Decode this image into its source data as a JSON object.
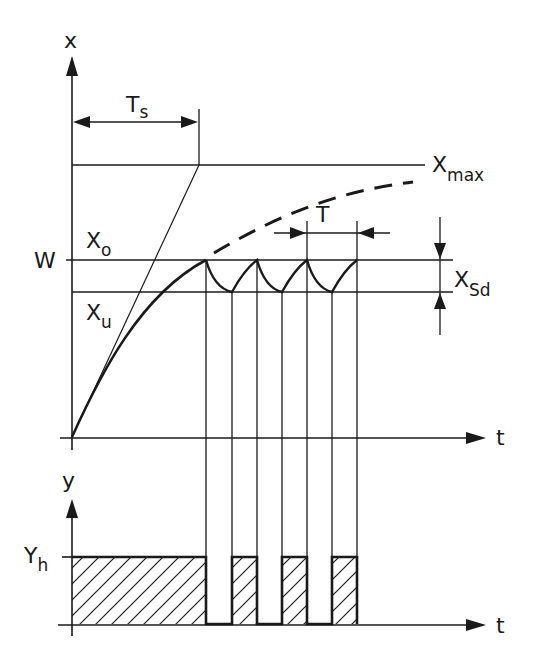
{
  "diagram": {
    "upper_plot": {
      "y_axis_label": "x",
      "x_axis_label": "t",
      "labels": {
        "ts_main": "T",
        "ts_sub": "s",
        "xmax_main": "X",
        "xmax_sub": "max",
        "xo_main": "X",
        "xo_sub": "o",
        "w": "W",
        "xu_main": "X",
        "xu_sub": "u",
        "period": "T",
        "xsd_main": "X",
        "xsd_sub": "Sd"
      },
      "levels": {
        "xmax": "Xmax",
        "xo": "Xo (upper switching point)",
        "w": "W (setpoint)",
        "xu": "Xu (lower switching point)"
      },
      "curves": [
        {
          "name": "step-response-solid",
          "style": "solid"
        },
        {
          "name": "uncontrolled-response",
          "style": "dashed"
        },
        {
          "name": "tangent-line",
          "style": "thin"
        },
        {
          "name": "oscillation",
          "style": "solid",
          "peaks": 4,
          "troughs": 3
        }
      ]
    },
    "lower_plot": {
      "y_axis_label": "y",
      "x_axis_label": "t",
      "level_label_main": "Y",
      "level_label_sub": "h",
      "pulses": [
        {
          "on": true,
          "segment": "initial"
        },
        {
          "on": false
        },
        {
          "on": true
        },
        {
          "on": false
        },
        {
          "on": true
        },
        {
          "on": false
        },
        {
          "on": true
        }
      ]
    },
    "colors": {
      "line": "#1a1a1a",
      "background": "#ffffff"
    }
  }
}
